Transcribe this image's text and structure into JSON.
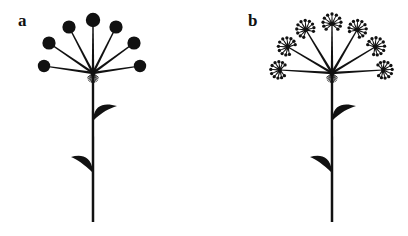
{
  "figure": {
    "type": "botanical-line-diagram",
    "background_color": "#ffffff",
    "ink_color": "#111111",
    "width": 408,
    "height": 236,
    "panel_count": 2
  },
  "panels": [
    {
      "id": "a",
      "label": "a",
      "label_x": 18,
      "label_y": 26,
      "name": "simple-umbel",
      "node": {
        "x": 93,
        "y": 73
      },
      "stem": {
        "x": 93,
        "top": 73,
        "bottom": 222,
        "width": 2.4
      },
      "ray_count": 7,
      "tip_style": "solid-disc",
      "tip_radius": 6.4,
      "rays": [
        {
          "index": 0,
          "tip_x": 44,
          "tip_y": 66,
          "disc_r": 6.2
        },
        {
          "index": 1,
          "tip_x": 49,
          "tip_y": 43,
          "disc_r": 6.6
        },
        {
          "index": 2,
          "tip_x": 69,
          "tip_y": 27,
          "disc_r": 6.6
        },
        {
          "index": 3,
          "tip_x": 93,
          "tip_y": 20,
          "disc_r": 7.2
        },
        {
          "index": 4,
          "tip_x": 116,
          "tip_y": 27,
          "disc_r": 6.6
        },
        {
          "index": 5,
          "tip_x": 134,
          "tip_y": 43,
          "disc_r": 6.6
        },
        {
          "index": 6,
          "tip_x": 140,
          "tip_y": 66,
          "disc_r": 6.2
        }
      ],
      "involucre_hairs": 11,
      "leaves": [
        {
          "index": 0,
          "side": "right",
          "attach_x": 93,
          "attach_y": 119,
          "tip_x": 117,
          "tip_y": 106
        },
        {
          "index": 1,
          "side": "left",
          "attach_x": 93,
          "attach_y": 171,
          "tip_x": 71,
          "tip_y": 157
        }
      ]
    },
    {
      "id": "b",
      "label": "b",
      "label_x": 248,
      "label_y": 26,
      "name": "compound-umbel",
      "node": {
        "x": 332,
        "y": 73
      },
      "stem": {
        "x": 332,
        "top": 73,
        "bottom": 222,
        "width": 2.4
      },
      "ray_count": 7,
      "tip_style": "umbellet",
      "umbellet_spokes": 11,
      "umbellet_radius": 9.5,
      "rays": [
        {
          "index": 0,
          "tip_x": 280,
          "tip_y": 70,
          "head_r": 9.0
        },
        {
          "index": 1,
          "tip_x": 288,
          "tip_y": 47,
          "head_r": 9.5
        },
        {
          "index": 2,
          "tip_x": 306,
          "tip_y": 30,
          "head_r": 9.5
        },
        {
          "index": 3,
          "tip_x": 332,
          "tip_y": 24,
          "head_r": 9.8
        },
        {
          "index": 4,
          "tip_x": 357,
          "tip_y": 30,
          "head_r": 9.5
        },
        {
          "index": 5,
          "tip_x": 375,
          "tip_y": 47,
          "head_r": 9.5
        },
        {
          "index": 6,
          "tip_x": 383,
          "tip_y": 70,
          "head_r": 9.0
        }
      ],
      "involucre_hairs": 11,
      "leaves": [
        {
          "index": 0,
          "side": "right",
          "attach_x": 332,
          "attach_y": 119,
          "tip_x": 356,
          "tip_y": 106
        },
        {
          "index": 1,
          "side": "left",
          "attach_x": 332,
          "attach_y": 171,
          "tip_x": 310,
          "tip_y": 157
        }
      ]
    }
  ]
}
